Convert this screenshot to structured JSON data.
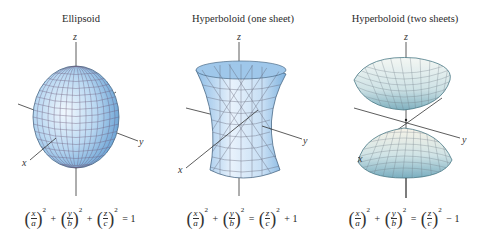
{
  "figure": {
    "panels": [
      {
        "title": "Ellipsoid",
        "axes": {
          "x": "x",
          "y": "y",
          "z": "z"
        },
        "equation": {
          "terms": [
            {
              "num": "x",
              "den": "a",
              "exp": "2"
            },
            {
              "num": "y",
              "den": "b",
              "exp": "2"
            },
            {
              "num": "z",
              "den": "c",
              "exp": "2"
            }
          ],
          "ops": [
            "+",
            "+"
          ],
          "rhs": "= 1"
        }
      },
      {
        "title": "Hyperboloid (one sheet)",
        "axes": {
          "x": "x",
          "y": "y",
          "z": "z"
        },
        "equation": {
          "terms": [
            {
              "num": "x",
              "den": "a",
              "exp": "2"
            },
            {
              "num": "y",
              "den": "b",
              "exp": "2"
            },
            {
              "num": "z",
              "den": "c",
              "exp": "2"
            }
          ],
          "ops": [
            "+",
            "="
          ],
          "rhs": "+ 1"
        }
      },
      {
        "title": "Hyperboloid (two sheets)",
        "axes": {
          "x": "x",
          "y": "y",
          "z": "z"
        },
        "equation": {
          "terms": [
            {
              "num": "x",
              "den": "a",
              "exp": "2"
            },
            {
              "num": "y",
              "den": "b",
              "exp": "2"
            },
            {
              "num": "z",
              "den": "c",
              "exp": "2"
            }
          ],
          "ops": [
            "+",
            "="
          ],
          "rhs": "− 1"
        }
      }
    ],
    "colors": {
      "surface_light": "#e6f1fb",
      "surface_mid": "#a9cdee",
      "surface_dark": "#6fa6d6",
      "grid": "#5a5a6e",
      "axis": "#333333"
    }
  }
}
